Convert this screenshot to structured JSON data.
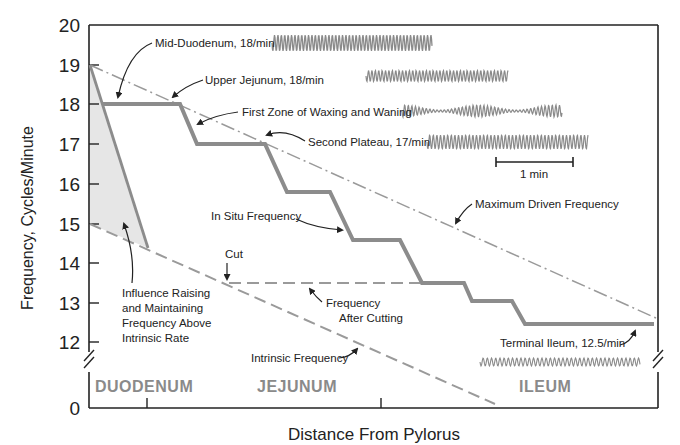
{
  "chart_data": {
    "type": "line",
    "title": "",
    "xlabel": "Distance From Pylorus",
    "ylabel": "Frequency, Cycles/Minute",
    "ylim": [
      0,
      20
    ],
    "y_axis_break": true,
    "y_ticks": [
      0,
      12,
      13,
      14,
      15,
      16,
      17,
      18,
      19,
      20
    ],
    "x_regions": [
      "DUODENUM",
      "JEJUNUM",
      "ILEUM"
    ],
    "grid": false,
    "series": [
      {
        "name": "In Situ Frequency",
        "style": "thick solid gray step",
        "x": [
          0.04,
          0.16,
          0.19,
          0.3,
          0.34,
          0.42,
          0.46,
          0.54,
          0.58,
          0.66,
          0.7,
          0.77,
          0.78,
          0.86,
          0.88,
          1.0
        ],
        "values": [
          18,
          18,
          17,
          17,
          15.8,
          15.8,
          14.6,
          14.6,
          13.5,
          13.5,
          13.05,
          13.05,
          12.5,
          12.5,
          12.5,
          12.5
        ]
      },
      {
        "name": "Maximum Driven Frequency",
        "style": "dash-dot",
        "x": [
          0.0,
          1.0
        ],
        "values": [
          19,
          12.6
        ]
      },
      {
        "name": "Intrinsic Frequency",
        "style": "dashed",
        "x": [
          0.0,
          0.71
        ],
        "values": [
          15,
          0.1
        ]
      },
      {
        "name": "Frequency After Cutting",
        "style": "dashed",
        "x": [
          0.1,
          0.58
        ],
        "values": [
          13.5,
          13.5
        ]
      },
      {
        "name": "Influence Raising and Maintaining Frequency Above Intrinsic Rate",
        "style": "shaded triangle",
        "x": [
          0.0,
          0.1,
          0.0
        ],
        "values": [
          19,
          14.4,
          15
        ]
      }
    ]
  },
  "axes": {
    "y_ticks": [
      {
        "label": "20",
        "y": 25
      },
      {
        "label": "19",
        "y": 65
      },
      {
        "label": "18",
        "y": 104
      },
      {
        "label": "17",
        "y": 144
      },
      {
        "label": "16",
        "y": 184
      },
      {
        "label": "15",
        "y": 224
      },
      {
        "label": "14",
        "y": 263
      },
      {
        "label": "13",
        "y": 303
      },
      {
        "label": "12",
        "y": 342
      },
      {
        "label": "0",
        "y": 408
      }
    ],
    "ylabel": "Frequency, Cycles/Minute",
    "xlabel": "Distance From Pylorus"
  },
  "regions": {
    "duodenum": "DUODENUM",
    "jejunum": "JEJUNUM",
    "ileum": "ILEUM"
  },
  "annotations": {
    "mid_duodenum": "Mid-Duodenum, 18/min",
    "upper_jejunum": "Upper Jejunum, 18/min",
    "first_zone": "First Zone of Waxing and Waning",
    "second_plateau": "Second Plateau, 17/min",
    "scale_bar": "1 min",
    "max_driven": "Maximum Driven Frequency",
    "in_situ": "In Situ Frequency",
    "cut": "Cut",
    "after_cutting_1": "Frequency",
    "after_cutting_2": "After Cutting",
    "influence_1": "Influence Raising",
    "influence_2": "and Maintaining",
    "influence_3": "Frequency Above",
    "influence_4": "Intrinsic Rate",
    "intrinsic": "Intrinsic Frequency",
    "terminal_ileum": "Terminal Ileum, 12.5/min"
  },
  "colors": {
    "axis": "#222222",
    "in_situ_line": "#8c8c8c",
    "dash_lines": "#9a9a9a",
    "shade": "#e6e6e6",
    "trace": "#8a8a8a",
    "region_text": "#8a8a8a"
  }
}
